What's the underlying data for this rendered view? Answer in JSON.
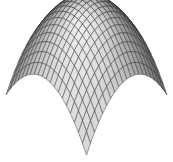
{
  "chart_data": {
    "type": "surface",
    "title": "",
    "xlabel": "",
    "ylabel": "",
    "zlabel": "",
    "function": "z = -(x^2 + y^2)",
    "x_range": [
      -1,
      1
    ],
    "y_range": [
      -1,
      1
    ],
    "grid_lines": 20,
    "axes_visible": false,
    "grid": false,
    "legend": null,
    "colors": {
      "face_light": "#ececec",
      "face_dark": "#5a5a5a",
      "edge": "#2a2a2a",
      "background": "#ffffff"
    },
    "projection": {
      "apex": [
        88,
        3
      ],
      "left_corner": [
        6,
        95
      ],
      "right_corner": [
        167,
        95
      ],
      "bottom_corner": [
        88,
        155
      ]
    }
  }
}
